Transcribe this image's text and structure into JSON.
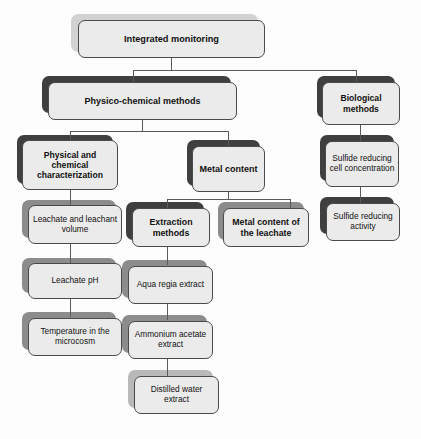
{
  "diagram": {
    "title": "Integrated monitoring",
    "type": "hierarchical-flowchart",
    "colors": {
      "node_fill": "#ebebeb",
      "node_border": "#4a4a4a",
      "shadow_dark": "#3f3f3f",
      "shadow_mid": "#8c8c8c",
      "shadow_light": "#b9b9b9",
      "shadow_pale": "#d2d2d2",
      "connector": "#5a5a5a",
      "text": "#111111",
      "background": "#fdfdfd"
    },
    "nodes": {
      "root": "Integrated monitoring",
      "physico_chemical": "Physico-chemical methods",
      "biological": "Biological methods",
      "phys_chem_char": "Physical and chemical characterization",
      "metal_content": "Metal content",
      "sulfide_cell_conc": "Sulfide reducing cell concentration",
      "leachate_volume": "Leachate and leachant volume",
      "extraction_methods": "Extraction methods",
      "metal_content_leachate": "Metal content of the leachate",
      "sulfide_activity": "Sulfide reducing activity",
      "leachate_ph": "Leachate pH",
      "temperature": "Temperature in the microcosm",
      "aqua_regia": "Aqua regia extract",
      "ammonium_acetate": "Ammonium acetate extract",
      "distilled_water": "Distilled water extract"
    }
  }
}
